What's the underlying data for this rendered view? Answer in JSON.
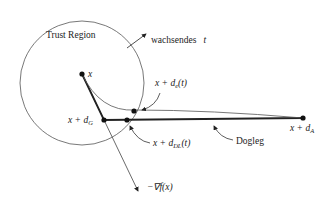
{
  "diagram": {
    "title_label": "Trust Region",
    "growth_label": "wachsendes",
    "growth_var": "t",
    "point_x": "x",
    "point_dG": {
      "base": "x + d",
      "sub": "G"
    },
    "point_dA": {
      "base": "x + d",
      "sub": "A"
    },
    "point_dDL": {
      "base": "x + d",
      "sub": "DL",
      "arg": "(t)"
    },
    "point_de": {
      "base": "x + d",
      "sub": "e",
      "arg": "(t)"
    },
    "dogleg_label": "Dogleg",
    "gradient_label": "−∇f(x)",
    "colors": {
      "stroke": "#222222",
      "thin": "#555555",
      "background": "#ffffff"
    }
  }
}
